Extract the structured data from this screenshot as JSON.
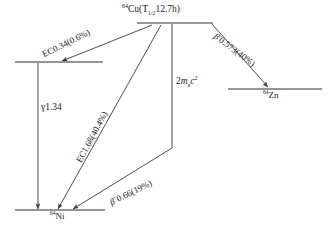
{
  "diagram": {
    "title_note": "Decay scheme of Cu-64",
    "levels": [
      {
        "id": "cu64",
        "label_html": "64Cu(T1/2 12.7h)",
        "isotope_mass": "64",
        "element": "Cu",
        "halflife_sub": "1/2",
        "halflife_text": "12.7h"
      },
      {
        "id": "ni64_excited",
        "label_html": ""
      },
      {
        "id": "zn64",
        "isotope_mass": "64",
        "element": "Zn"
      },
      {
        "id": "ni64_ground",
        "isotope_mass": "64",
        "element": "Ni"
      }
    ],
    "transitions": [
      {
        "id": "ec034",
        "label": "EC0.34(0.6%)",
        "mode": "EC",
        "energy_mev": 0.34,
        "intensity_pct": 0.6
      },
      {
        "id": "beta_minus",
        "label": "0.573(40%)",
        "symbol": "B",
        "charge": "-",
        "mode": "beta-minus",
        "energy_mev": 0.573,
        "intensity_pct": 40
      },
      {
        "id": "ec168",
        "label": "EC1.68(40.4%)",
        "mode": "EC",
        "energy_mev": 1.68,
        "intensity_pct": 40.4
      },
      {
        "id": "beta_plus",
        "label": "0.66(19%)",
        "symbol": "B",
        "charge": "+",
        "mode": "beta-plus",
        "energy_mev": 0.66,
        "intensity_pct": 19
      },
      {
        "id": "gamma",
        "label": "1.34",
        "symbol": "g",
        "mode": "gamma",
        "energy_mev": 1.34
      },
      {
        "id": "rest_mass",
        "label": "2",
        "symbol_m": "m",
        "symbol_sub": "e",
        "symbol_c": "c",
        "exponent": "2"
      }
    ]
  }
}
